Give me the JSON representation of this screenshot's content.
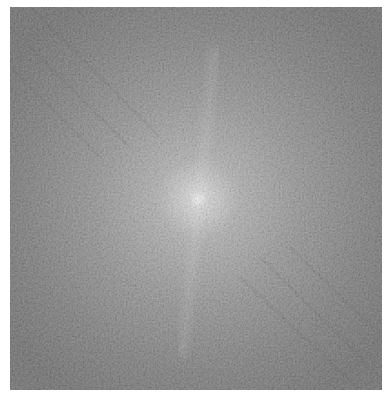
{
  "image": {
    "description": "Grayscale Fourier magnitude spectrum with bright central peak and faint streaks",
    "center": {
      "x": 188,
      "y": 192
    },
    "colors": {
      "background_page": "#ffffff",
      "edge_tone": "#555555",
      "mid_tone": "#7a7a7a",
      "center_peak": "#ffffff"
    }
  }
}
